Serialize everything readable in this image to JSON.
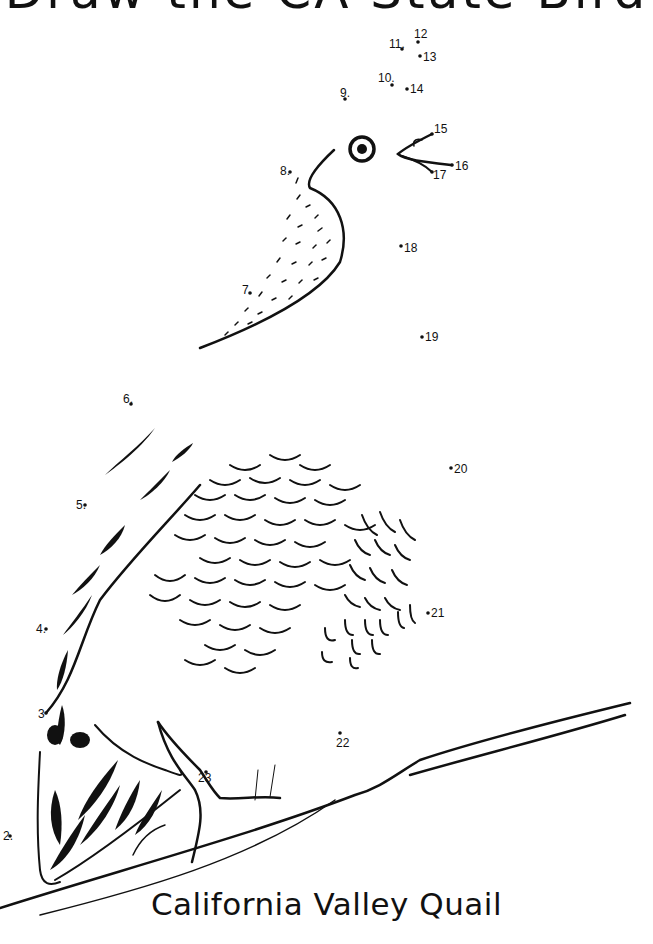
{
  "header": {
    "title": "Draw the CA State Bird"
  },
  "caption": "California Valley Quail",
  "dots": [
    {
      "n": "2.",
      "x": 10,
      "y": 836,
      "lx": 3,
      "ly": 840
    },
    {
      "n": "3",
      "x": 46,
      "y": 713,
      "lx": 38,
      "ly": 718
    },
    {
      "n": "4.",
      "x": 46,
      "y": 629,
      "lx": 36,
      "ly": 633
    },
    {
      "n": "5.",
      "x": 85,
      "y": 505,
      "lx": 76,
      "ly": 509
    },
    {
      "n": "6.",
      "x": 131,
      "y": 404,
      "lx": 123,
      "ly": 403
    },
    {
      "n": "7.",
      "x": 250,
      "y": 293,
      "lx": 242,
      "ly": 294
    },
    {
      "n": "8.",
      "x": 290,
      "y": 172,
      "lx": 280,
      "ly": 175
    },
    {
      "n": "9.",
      "x": 345,
      "y": 99,
      "lx": 340,
      "ly": 97
    },
    {
      "n": "10.",
      "x": 392,
      "y": 85,
      "lx": 378,
      "ly": 82
    },
    {
      "n": "11.",
      "x": 402,
      "y": 49,
      "lx": 389,
      "ly": 48
    },
    {
      "n": "12",
      "x": 418,
      "y": 42,
      "lx": 414,
      "ly": 38
    },
    {
      "n": "13",
      "x": 420,
      "y": 56,
      "lx": 423,
      "ly": 61
    },
    {
      "n": "14",
      "x": 407,
      "y": 89,
      "lx": 410,
      "ly": 93
    },
    {
      "n": "15",
      "x": 432,
      "y": 134,
      "lx": 434,
      "ly": 133
    },
    {
      "n": "16",
      "x": 452,
      "y": 165,
      "lx": 455,
      "ly": 170
    },
    {
      "n": "17",
      "x": 432,
      "y": 172,
      "lx": 433,
      "ly": 179
    },
    {
      "n": "18",
      "x": 401,
      "y": 246,
      "lx": 404,
      "ly": 252
    },
    {
      "n": "19",
      "x": 422,
      "y": 337,
      "lx": 425,
      "ly": 341
    },
    {
      "n": "20",
      "x": 451,
      "y": 468,
      "lx": 454,
      "ly": 473
    },
    {
      "n": "21",
      "x": 428,
      "y": 613,
      "lx": 431,
      "ly": 617
    },
    {
      "n": "22",
      "x": 340,
      "y": 733,
      "lx": 336,
      "ly": 747
    },
    {
      "n": "23",
      "x": 206,
      "y": 772,
      "lx": 198,
      "ly": 782
    }
  ]
}
